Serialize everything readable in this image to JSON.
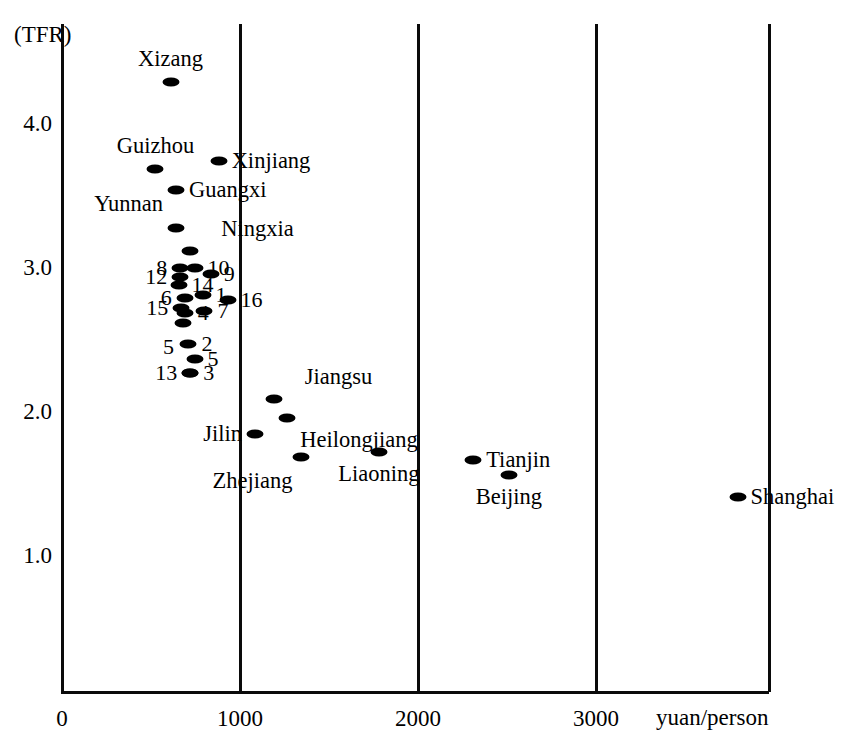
{
  "chart_data": {
    "type": "scatter",
    "title": "",
    "ylabel": "(TFR)",
    "xlabel": "yuan/person",
    "xlim": [
      0,
      3970
    ],
    "ylim": [
      0.54,
      4.56
    ],
    "xticks": [
      "0",
      "1000",
      "2000",
      "3000"
    ],
    "xtick_values": [
      0,
      1000,
      2000,
      3000
    ],
    "yticks": [
      "4.0",
      "3.0",
      "2.0",
      "1.0"
    ],
    "ytick_values": [
      4.0,
      3.0,
      2.0,
      1.0
    ],
    "grid": "vertical",
    "legend": "none",
    "points": [
      {
        "label": "Xizang",
        "x": 610,
        "y": 4.29,
        "label_pos": "above"
      },
      {
        "label": "Guizhou",
        "x": 525,
        "y": 3.69,
        "label_pos": "above"
      },
      {
        "label": "Xinjiang",
        "x": 880,
        "y": 3.74,
        "label_pos": "right"
      },
      {
        "label": "Guangxi",
        "x": 640,
        "y": 3.54,
        "label_pos": "right"
      },
      {
        "label": "Yunnan",
        "x": 640,
        "y": 3.28,
        "label_pos": "above-left"
      },
      {
        "label": "Ningxia",
        "x": 720,
        "y": 3.12,
        "label_pos": "above-right"
      },
      {
        "label": "8",
        "x": 665,
        "y": 3.0,
        "label_pos": "left"
      },
      {
        "label": "10",
        "x": 745,
        "y": 3.0,
        "label_pos": "right"
      },
      {
        "label": "12",
        "x": 665,
        "y": 2.94,
        "label_pos": "left"
      },
      {
        "label": "9",
        "x": 835,
        "y": 2.96,
        "label_pos": "right"
      },
      {
        "label": "14",
        "x": 655,
        "y": 2.88,
        "label_pos": "right"
      },
      {
        "label": "1",
        "x": 790,
        "y": 2.81,
        "label_pos": "right"
      },
      {
        "label": "6",
        "x": 690,
        "y": 2.79,
        "label_pos": "left"
      },
      {
        "label": "16",
        "x": 930,
        "y": 2.78,
        "label_pos": "right"
      },
      {
        "label": "4",
        "x": 690,
        "y": 2.69,
        "label_pos": "right"
      },
      {
        "label": "15",
        "x": 670,
        "y": 2.72,
        "label_pos": "left"
      },
      {
        "label": "7",
        "x": 800,
        "y": 2.7,
        "label_pos": "right"
      },
      {
        "label": "5",
        "x": 680,
        "y": 2.62,
        "label_pos": "below-left"
      },
      {
        "label": "2",
        "x": 710,
        "y": 2.47,
        "label_pos": "right"
      },
      {
        "label": "5",
        "x": 745,
        "y": 2.37,
        "label_pos": "right"
      },
      {
        "label": "3",
        "x": 720,
        "y": 2.27,
        "label_pos": "right"
      },
      {
        "label": "13",
        "x": 720,
        "y": 2.27,
        "label_pos": "left"
      },
      {
        "label": "Jiangsu",
        "x": 1190,
        "y": 2.09,
        "label_pos": "above-right"
      },
      {
        "label": "Heilongjiang",
        "x": 1265,
        "y": 1.96,
        "label_pos": "below-right"
      },
      {
        "label": "Jilin",
        "x": 1085,
        "y": 1.85,
        "label_pos": "left"
      },
      {
        "label": "Zhejiang",
        "x": 1345,
        "y": 1.69,
        "label_pos": "below-left"
      },
      {
        "label": "Liaoning",
        "x": 1780,
        "y": 1.72,
        "label_pos": "below"
      },
      {
        "label": "Tianjin",
        "x": 2310,
        "y": 1.67,
        "label_pos": "right"
      },
      {
        "label": "Beijing",
        "x": 2510,
        "y": 1.56,
        "label_pos": "below"
      },
      {
        "label": "Shanghai",
        "x": 3795,
        "y": 1.41,
        "label_pos": "right"
      }
    ]
  },
  "axes": {
    "y_caption": "(TFR)",
    "x_caption": "yuan/person"
  }
}
